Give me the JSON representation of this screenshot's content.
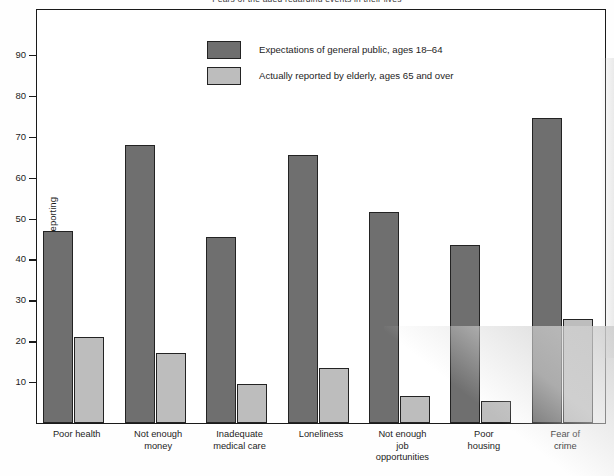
{
  "chart_data": {
    "type": "bar",
    "title": "Fears of the aged regarding events in their lives",
    "xlabel": "",
    "ylabel": "Percent reporting",
    "ylim": [
      0,
      95
    ],
    "yticks": [
      10,
      20,
      30,
      40,
      50,
      60,
      70,
      80,
      90
    ],
    "grid": false,
    "legend_position": "upper-center",
    "categories": [
      "Poor health",
      "Not enough money",
      "Inadequate medical care",
      "Loneliness",
      "Not enough job opportunities",
      "Poor housing",
      "Fear of crime"
    ],
    "category_lines": [
      [
        "Poor health"
      ],
      [
        "Not enough",
        "money"
      ],
      [
        "Inadequate",
        "medical care"
      ],
      [
        "Loneliness"
      ],
      [
        "Not enough",
        "job",
        "opportunities"
      ],
      [
        "Poor",
        "housing"
      ],
      [
        "Fear of",
        "crime"
      ]
    ],
    "series": [
      {
        "name": "Expectations of general public, ages 18–64",
        "color": "#6f6f6f",
        "values": [
          47,
          68,
          45.5,
          65.5,
          51.5,
          43.5,
          74.5
        ]
      },
      {
        "name": "Actually reported by elderly, ages 65 and over",
        "color": "#bdbdbd",
        "values": [
          21,
          17,
          9.5,
          13.5,
          6.5,
          5.5,
          25.5
        ]
      }
    ]
  },
  "axis": {
    "y_label": "Percent reporting",
    "y_ticks": [
      "90",
      "80",
      "70",
      "60",
      "50",
      "40",
      "30",
      "20",
      "10"
    ]
  },
  "legend": {
    "items": [
      {
        "label": "Expectations of general public, ages 18–64",
        "swatch": "dark"
      },
      {
        "label": "Actually reported by elderly, ages 65 and over",
        "swatch": "light"
      }
    ]
  },
  "colors": {
    "series_dark": "#6f6f6f",
    "series_light": "#bdbdbd",
    "axis": "#1a1a1a",
    "text": "#1d1d1d",
    "plot_background": "#ffffff"
  }
}
